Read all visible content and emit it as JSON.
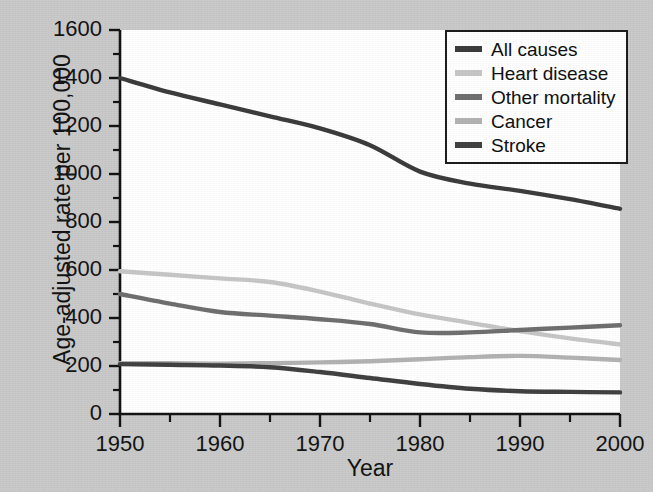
{
  "chart_data": {
    "type": "line",
    "title": "",
    "xlabel": "Year",
    "ylabel": "Age-adjusted rate per 100,000",
    "xlim": [
      1950,
      2000
    ],
    "ylim": [
      0,
      1600
    ],
    "xticks": [
      "1950",
      "1960",
      "1970",
      "1980",
      "1990",
      "2000"
    ],
    "yticks": [
      "0",
      "200",
      "400",
      "600",
      "800",
      "1000",
      "1200",
      "1400",
      "1600"
    ],
    "minor_xtick_interval": 5,
    "minor_ytick_interval": 100,
    "grid": false,
    "legend_position": "top-right",
    "x": [
      1950,
      1955,
      1960,
      1965,
      1970,
      1975,
      1980,
      1985,
      1990,
      1995,
      2000
    ],
    "series": [
      {
        "name": "All causes",
        "color": "#3a3a3a",
        "values": [
          1400,
          1340,
          1290,
          1240,
          1190,
          1120,
          1010,
          960,
          930,
          895,
          855
        ]
      },
      {
        "name": "Heart disease",
        "color": "#c6c6c6",
        "values": [
          595,
          580,
          565,
          550,
          510,
          460,
          415,
          380,
          345,
          315,
          290
        ]
      },
      {
        "name": "Other mortality",
        "color": "#6e6e6e",
        "values": [
          500,
          460,
          425,
          410,
          395,
          375,
          340,
          340,
          350,
          360,
          370
        ]
      },
      {
        "name": "Cancer",
        "color": "#b2b2b2",
        "values": [
          212,
          212,
          210,
          212,
          215,
          220,
          228,
          237,
          242,
          235,
          225
        ]
      },
      {
        "name": "Stroke",
        "color": "#3f3f3f",
        "values": [
          208,
          205,
          202,
          195,
          175,
          150,
          125,
          105,
          95,
          92,
          90
        ]
      }
    ]
  },
  "axes": {
    "ylabel": "Age-adjusted rate per 100,000",
    "xlabel": "Year"
  },
  "legend": {
    "items": [
      {
        "label": "All causes",
        "color": "#3a3a3a"
      },
      {
        "label": "Heart disease",
        "color": "#c6c6c6"
      },
      {
        "label": "Other mortality",
        "color": "#6e6e6e"
      },
      {
        "label": "Cancer",
        "color": "#b2b2b2"
      },
      {
        "label": "Stroke",
        "color": "#3f3f3f"
      }
    ]
  },
  "background_bleed_text": "ated with the age-adjusted rates the combined mortality of the cancer and the stroke deaths declined in the period whereas other mortality causes remained stable in the later years"
}
